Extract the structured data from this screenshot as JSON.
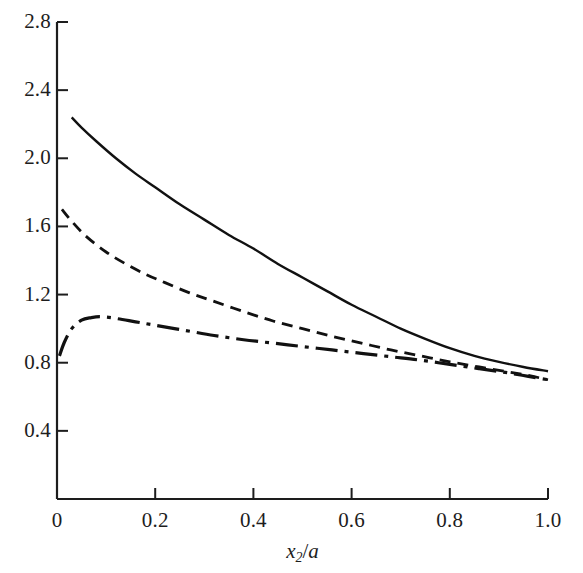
{
  "chart_data": {
    "type": "line",
    "title": "",
    "subtitle": "",
    "xlabel": "x₂/a",
    "ylabel": "",
    "xlim": [
      0,
      1.0
    ],
    "ylim": [
      0,
      2.8
    ],
    "grid": false,
    "legend": "none",
    "xticks": [
      "0",
      "0.2",
      "0.4",
      "0.6",
      "0.8",
      "1.0"
    ],
    "xtick_values": [
      0,
      0.2,
      0.4,
      0.6,
      0.8,
      1.0
    ],
    "yticks": [
      "0.4",
      "0.8",
      "1.2",
      "1.6",
      "2.0",
      "2.4",
      "2.8"
    ],
    "ytick_values": [
      0.4,
      0.8,
      1.2,
      1.6,
      2.0,
      2.4,
      2.8
    ],
    "axis_color": "#1d1d1d",
    "series": [
      {
        "name": "solid-curve",
        "style": "solid",
        "color": "#111111",
        "x": [
          0.03,
          0.05,
          0.08,
          0.12,
          0.16,
          0.2,
          0.25,
          0.3,
          0.35,
          0.4,
          0.45,
          0.5,
          0.55,
          0.6,
          0.65,
          0.7,
          0.75,
          0.8,
          0.85,
          0.9,
          0.95,
          1.0
        ],
        "y": [
          2.24,
          2.18,
          2.1,
          2.0,
          1.91,
          1.83,
          1.73,
          1.64,
          1.55,
          1.47,
          1.38,
          1.3,
          1.22,
          1.14,
          1.07,
          1.0,
          0.94,
          0.885,
          0.84,
          0.805,
          0.775,
          0.75
        ]
      },
      {
        "name": "dashed-curve",
        "style": "dashed",
        "color": "#111111",
        "x": [
          0.01,
          0.03,
          0.06,
          0.1,
          0.14,
          0.18,
          0.22,
          0.27,
          0.32,
          0.38,
          0.44,
          0.5,
          0.56,
          0.62,
          0.68,
          0.74,
          0.8,
          0.86,
          0.92,
          0.96,
          1.0
        ],
        "y": [
          1.7,
          1.63,
          1.54,
          1.45,
          1.38,
          1.32,
          1.27,
          1.21,
          1.16,
          1.1,
          1.045,
          1.0,
          0.955,
          0.915,
          0.875,
          0.84,
          0.805,
          0.775,
          0.745,
          0.725,
          0.7
        ]
      },
      {
        "name": "dash-dot-curve",
        "style": "dashdot",
        "color": "#111111",
        "x": [
          0.005,
          0.015,
          0.03,
          0.05,
          0.07,
          0.09,
          0.12,
          0.16,
          0.2,
          0.26,
          0.32,
          0.38,
          0.44,
          0.5,
          0.56,
          0.62,
          0.68,
          0.74,
          0.8,
          0.86,
          0.92,
          0.96,
          1.0
        ],
        "y": [
          0.84,
          0.92,
          1.0,
          1.05,
          1.065,
          1.07,
          1.06,
          1.04,
          1.02,
          0.99,
          0.96,
          0.935,
          0.915,
          0.895,
          0.875,
          0.855,
          0.835,
          0.815,
          0.79,
          0.765,
          0.74,
          0.72,
          0.7
        ]
      }
    ]
  }
}
